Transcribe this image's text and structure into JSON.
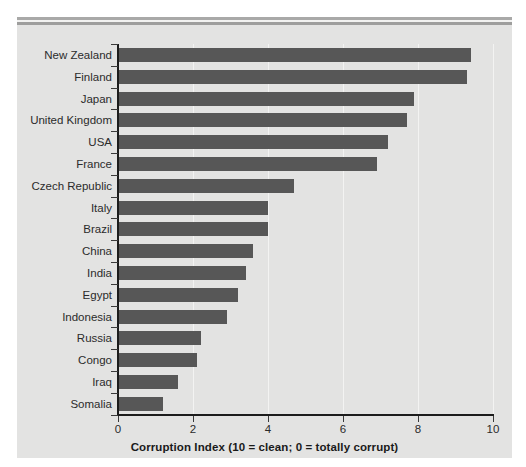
{
  "chart_data": {
    "type": "bar",
    "orientation": "horizontal",
    "title": "",
    "xlabel": "Corruption Index (10 = clean; 0 = totally corrupt)",
    "ylabel": "",
    "xlim": [
      0,
      10
    ],
    "xticks": [
      "0",
      "2",
      "4",
      "6",
      "8",
      "10"
    ],
    "xtick_values": [
      0,
      2,
      4,
      6,
      8,
      10
    ],
    "grid": "vertical-faint",
    "legend": "none",
    "bar_color": "#575757",
    "panel_color": "#e3e3e2",
    "categories": [
      "New Zealand",
      "Finland",
      "Japan",
      "United Kingdom",
      "USA",
      "France",
      "Czech Republic",
      "Italy",
      "Brazil",
      "China",
      "India",
      "Egypt",
      "Indonesia",
      "Russia",
      "Congo",
      "Iraq",
      "Somalia"
    ],
    "values": [
      9.4,
      9.3,
      7.9,
      7.7,
      7.2,
      6.9,
      4.7,
      4.0,
      4.0,
      3.6,
      3.4,
      3.2,
      2.9,
      2.2,
      2.1,
      1.6,
      1.2
    ]
  }
}
